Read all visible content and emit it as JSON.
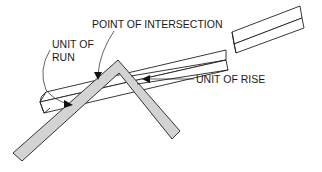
{
  "figure": {
    "top_fragment_text": "",
    "labels": {
      "point_of_intersection": "POINT OF INTERSECTION",
      "unit_of_run_line1": "UNIT OF",
      "unit_of_run_line2": "RUN",
      "unit_of_rise": "UNIT OF RISE"
    },
    "colors": {
      "square_fill": "#d3d3d3",
      "line": "#222222",
      "background": "#ffffff"
    }
  }
}
